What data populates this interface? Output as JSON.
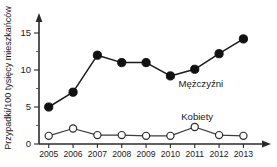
{
  "chart_data": {
    "type": "line",
    "title": "",
    "subtitle": "",
    "xlabel": "",
    "ylabel": "Przypadki/100 tysięcy mieszkańców",
    "categories": [
      "2005",
      "2006",
      "2007",
      "2008",
      "2009",
      "2010",
      "2011",
      "2012",
      "2013"
    ],
    "x": [
      2005,
      2006,
      2007,
      2008,
      2009,
      2010,
      2011,
      2012,
      2013
    ],
    "series": [
      {
        "name": "Mężczyźni",
        "marker": "filled-circle",
        "values": [
          5.0,
          7.0,
          12.0,
          11.0,
          11.0,
          9.2,
          10.1,
          12.2,
          14.2
        ]
      },
      {
        "name": "Kobiety",
        "marker": "open-circle",
        "values": [
          1.1,
          2.1,
          1.2,
          1.2,
          1.1,
          1.1,
          2.3,
          1.2,
          1.1
        ]
      }
    ],
    "ylim": [
      0,
      16.2
    ],
    "xlim": [
      2004.6,
      2013.6
    ],
    "yticks": [
      0,
      5,
      10,
      15
    ],
    "ytick_labels": [
      "0",
      "5",
      "10",
      "15"
    ],
    "yticks_minor": [
      2.5,
      7.5,
      12.5
    ],
    "grid": false,
    "legend_position": "inline-annotation",
    "legend_entries": [
      {
        "label": "Mężczyźni",
        "anchor_x": 2011.25,
        "anchor_y": 8.1
      },
      {
        "label": "Kobiety",
        "anchor_x": 2011.1,
        "anchor_y": 3.55
      }
    ],
    "axis_arrows": {
      "y_top": true,
      "x_right": true
    },
    "colors": {
      "men_marker": "#111111",
      "women_marker_fill": "#ffffff",
      "women_marker_stroke": "#2b2b2b",
      "line": "#1a1a1a",
      "axis": "#2b2b2b",
      "text": "#1a1a1a",
      "background": "#ffffff"
    }
  }
}
